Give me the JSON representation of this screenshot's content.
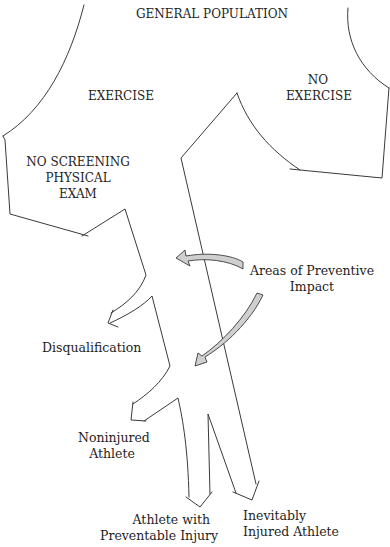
{
  "diagram": {
    "title": "GENERAL POPULATION",
    "colors": {
      "line": "#3a3a3a",
      "arrow_fill": "#cfcfcf",
      "text": "#1e1e1e",
      "background": "#ffffff"
    },
    "branches": {
      "exercise": "EXERCISE",
      "no_exercise_line1": "NO",
      "no_exercise_line2": "EXERCISE",
      "no_screening_line1": "NO SCREENING",
      "no_screening_line2": "PHYSICAL",
      "no_screening_line3": "EXAM"
    },
    "outcomes": {
      "disqualification": "Disqualification",
      "noninjured_line1": "Noninjured",
      "noninjured_line2": "Athlete",
      "preventable_line1": "Athlete with",
      "preventable_line2": "Preventable Injury",
      "inevitable_line1": "Inevitably",
      "inevitable_line2": "Injured Athlete"
    },
    "annotation": {
      "line1": "Areas of Preventive",
      "line2": "Impact",
      "arrow_count": 2
    }
  }
}
